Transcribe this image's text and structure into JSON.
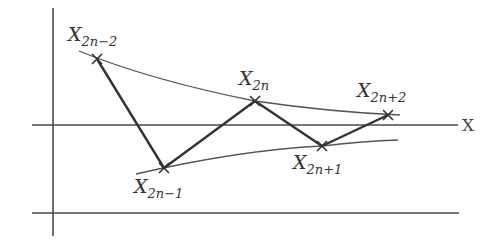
{
  "diagram": {
    "axis_label": "X",
    "points": [
      {
        "id": "x_2n_minus_2",
        "base": "X",
        "subscript": "2n−2"
      },
      {
        "id": "x_2n_minus_1",
        "base": "X",
        "subscript": "2n−1"
      },
      {
        "id": "x_2n",
        "base": "X",
        "subscript": "2n"
      },
      {
        "id": "x_2n_plus_1",
        "base": "X",
        "subscript": "2n+1"
      },
      {
        "id": "x_2n_plus_2",
        "base": "X",
        "subscript": "2n+2"
      }
    ],
    "edges": [
      [
        "x_2n_minus_2",
        "x_2n_minus_1"
      ],
      [
        "x_2n_minus_1",
        "x_2n"
      ],
      [
        "x_2n",
        "x_2n_plus_1"
      ],
      [
        "x_2n_plus_1",
        "x_2n_plus_2"
      ]
    ],
    "envelopes": [
      "upper-envelope",
      "lower-envelope"
    ]
  }
}
